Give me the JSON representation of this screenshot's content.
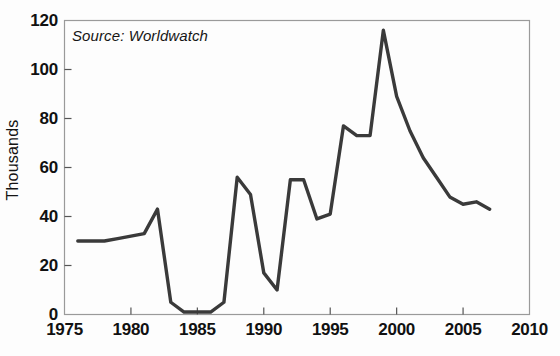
{
  "annotation": {
    "source_text": "Source: Worldwatch"
  },
  "axis": {
    "y_title": "Thousands",
    "y_ticks": [
      "0",
      "20",
      "40",
      "60",
      "80",
      "100",
      "120"
    ],
    "x_ticks": [
      "1975",
      "1980",
      "1985",
      "1990",
      "1995",
      "2000",
      "2005",
      "2010"
    ]
  },
  "colors": {
    "line": "#3a3a3a",
    "frame": "#9a9a9a",
    "text": "#111111",
    "background": "#fdfdfd"
  },
  "chart_data": {
    "type": "line",
    "title": "",
    "subtitle": "",
    "xlabel": "",
    "ylabel": "Thousands",
    "xlim": [
      1975,
      2010
    ],
    "ylim": [
      0,
      120
    ],
    "xticks": [
      1975,
      1980,
      1985,
      1990,
      1995,
      2000,
      2005,
      2010
    ],
    "yticks": [
      0,
      20,
      40,
      60,
      80,
      100,
      120
    ],
    "grid": false,
    "legend": null,
    "annotations": [
      "Source: Worldwatch"
    ],
    "units": "thousands",
    "x": [
      1976,
      1977,
      1978,
      1979,
      1980,
      1981,
      1982,
      1983,
      1984,
      1985,
      1986,
      1987,
      1988,
      1989,
      1990,
      1991,
      1992,
      1993,
      1994,
      1995,
      1996,
      1997,
      1998,
      1999,
      2000,
      2001,
      2002,
      2003,
      2004,
      2005,
      2006,
      2007
    ],
    "values": [
      30,
      30,
      30,
      31,
      32,
      33,
      43,
      5,
      1,
      1,
      1,
      5,
      56,
      49,
      17,
      10,
      55,
      55,
      39,
      41,
      77,
      73,
      73,
      116,
      89,
      75,
      64,
      56,
      48,
      45,
      46,
      43
    ]
  }
}
